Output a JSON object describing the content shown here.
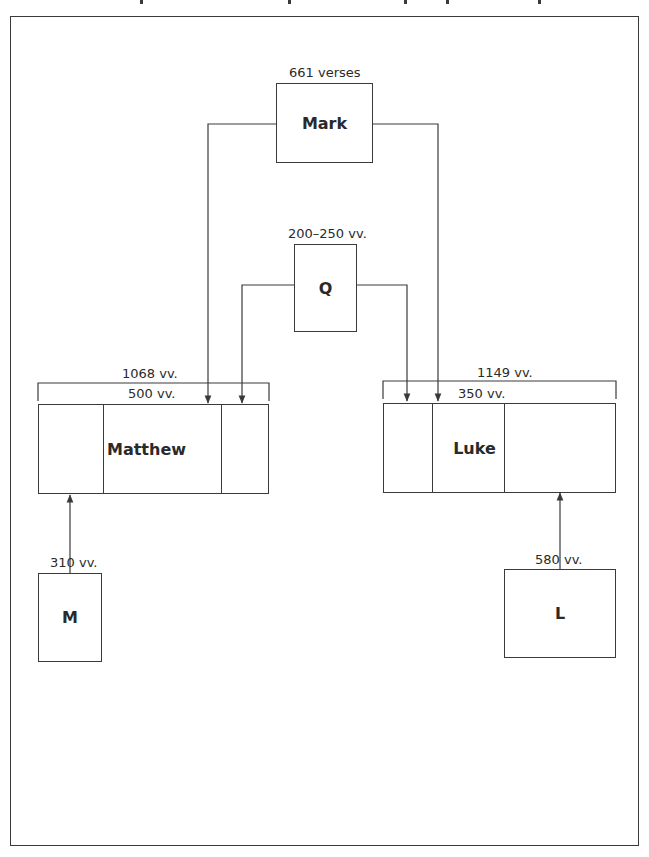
{
  "diagram": {
    "type": "synoptic-source-diagram",
    "nodes": {
      "mark": {
        "label": "Mark",
        "count_label": "661 verses"
      },
      "q": {
        "label": "Q",
        "count_label": "200–250 vv."
      },
      "matthew": {
        "label": "Matthew",
        "total_label": "1068 vv.",
        "shared_label": "500 vv."
      },
      "luke": {
        "label": "Luke",
        "total_label": "1149 vv.",
        "shared_label": "350 vv."
      },
      "m": {
        "label": "M",
        "count_label": "310 vv."
      },
      "l": {
        "label": "L",
        "count_label": "580 vv."
      }
    },
    "edges": [
      {
        "from": "Mark",
        "to": "Matthew"
      },
      {
        "from": "Mark",
        "to": "Luke"
      },
      {
        "from": "Q",
        "to": "Matthew"
      },
      {
        "from": "Q",
        "to": "Luke"
      },
      {
        "from": "M",
        "to": "Matthew"
      },
      {
        "from": "L",
        "to": "Luke"
      }
    ],
    "colors": {
      "stroke": "#3a3a3a",
      "text": "#2a2a2a",
      "background": "#ffffff"
    }
  }
}
